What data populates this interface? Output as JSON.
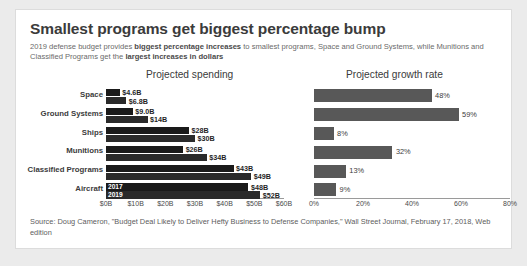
{
  "card": {
    "title": "Smallest programs get biggest percentage bump",
    "subtitle_parts": [
      {
        "text": "2019 defense budget provides ",
        "bold": false
      },
      {
        "text": "biggest percentage increases",
        "bold": true
      },
      {
        "text": " to smallest programs, Space and Ground Systems, while Munitions and Classified Programs get the ",
        "bold": false
      },
      {
        "text": "largest increases in dollars",
        "bold": true
      }
    ],
    "source": "Source: Doug Cameron, \"Budget Deal Likely to Deliver Hefty Business to Defense Companies,\" Wall Street Journal, February 17, 2018, Web edition"
  },
  "chart_data": [
    {
      "type": "bar",
      "title": "Projected spending",
      "orientation": "horizontal",
      "grouped": true,
      "categories": [
        "Space",
        "Ground Systems",
        "Ships",
        "Munitions",
        "Classified Programs",
        "Aircraft"
      ],
      "series": [
        {
          "name": "2017",
          "values": [
            4.6,
            9.0,
            28,
            26,
            43,
            48
          ],
          "labels": [
            "$4.6B",
            "$9.0B",
            "$28B",
            "$26B",
            "$43B",
            "$48B"
          ]
        },
        {
          "name": "2019",
          "values": [
            6.8,
            14,
            30,
            34,
            49,
            52
          ],
          "labels": [
            "$6.8B",
            "$14B",
            "$30B",
            "$34B",
            "$49B",
            "$52B"
          ]
        }
      ],
      "xlabel": "",
      "ylabel": "",
      "xlim": [
        0,
        60
      ],
      "xticks": [
        0,
        10,
        20,
        30,
        40,
        50,
        60
      ],
      "xtick_labels": [
        "$0B",
        "$10B",
        "$20B",
        "$30B",
        "$40B",
        "$50B",
        "$60B"
      ],
      "grid": false,
      "legend": {
        "position": "in-plot-last-category",
        "entries": [
          "2017",
          "2019"
        ]
      },
      "colors": {
        "series_2017": "#1a1a1a",
        "series_2019": "#2a2a2a"
      }
    },
    {
      "type": "bar",
      "title": "Projected growth rate",
      "orientation": "horizontal",
      "grouped": false,
      "categories": [
        "Space",
        "Ground Systems",
        "Ships",
        "Munitions",
        "Classified Programs",
        "Aircraft"
      ],
      "values": [
        48,
        59,
        8,
        32,
        13,
        9
      ],
      "labels": [
        "48%",
        "59%",
        "8%",
        "32%",
        "13%",
        "9%"
      ],
      "xlabel": "",
      "ylabel": "",
      "xlim": [
        0,
        80
      ],
      "xticks": [
        0,
        20,
        40,
        60,
        80
      ],
      "xtick_labels": [
        "0%",
        "20%",
        "40%",
        "60%",
        "80%"
      ],
      "grid": false,
      "colors": {
        "bars": "#585858"
      }
    }
  ]
}
